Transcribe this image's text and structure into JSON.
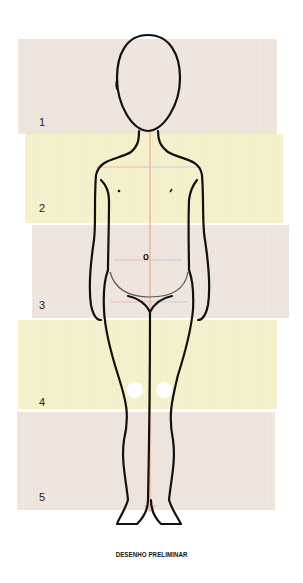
{
  "illustration": {
    "title": "DESENHO PRELIMINAR",
    "subject": "child-figure-front-view",
    "bands": [
      {
        "label": "1",
        "color": "#ede3da",
        "x": 18,
        "y": 39,
        "w": 259,
        "h": 95
      },
      {
        "label": "2",
        "color": "#f3efc8",
        "x": 25,
        "y": 134,
        "w": 258,
        "h": 89
      },
      {
        "label": "3",
        "color": "#ede3da",
        "x": 32,
        "y": 225,
        "w": 257,
        "h": 93
      },
      {
        "label": "4",
        "color": "#f3efc8",
        "x": 18,
        "y": 320,
        "w": 259,
        "h": 89
      },
      {
        "label": "5",
        "color": "#ede3da",
        "x": 17,
        "y": 412,
        "w": 258,
        "h": 98
      }
    ],
    "guide_colors": {
      "center_line": "#f4b7a0",
      "left_guides": "#f2b8b8",
      "right_guides": "#bcd3e6",
      "outline": "#111111",
      "knee_marks": "#ffffff"
    }
  }
}
